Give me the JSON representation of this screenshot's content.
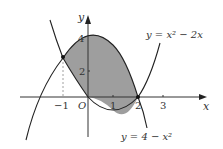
{
  "diagram": {
    "curve1_label": "y = x² − 2x",
    "curve2_label": "y = 4 − x²",
    "x_axis_label": "x",
    "y_axis_label": "y",
    "origin_label": "O",
    "x_ticks": [
      "−1",
      "1",
      "2",
      "3"
    ],
    "y_ticks": [
      "2",
      "4"
    ],
    "intersection_points": [
      "(−1, 3)",
      "(2, 0)"
    ],
    "shade_color": "#9e9e9e",
    "line_color": "#222222"
  }
}
